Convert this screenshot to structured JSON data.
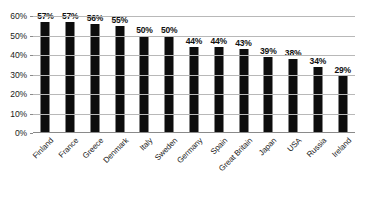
{
  "chart_data": {
    "type": "bar",
    "title": "",
    "subtitle": "",
    "xlabel": "",
    "ylabel": "",
    "ylim": [
      0,
      60
    ],
    "grid": true,
    "legend": false,
    "orientation": "vertical",
    "bar_color": "#0d0d0d",
    "gridline_color": "#b8b8b8",
    "background_color": "#ffffff",
    "categories": [
      "Finland",
      "France",
      "Greece",
      "Denmark",
      "Italy",
      "Sweden",
      "Germany",
      "Spain",
      "Great Britain",
      "Japan",
      "USA",
      "Russia",
      "Ireland"
    ],
    "values": [
      57,
      57,
      56,
      55,
      50,
      50,
      44,
      44,
      43,
      39,
      38,
      34,
      29
    ],
    "data_labels": [
      "57%",
      "57%",
      "56%",
      "55%",
      "50%",
      "50%",
      "44%",
      "44%",
      "43%",
      "39%",
      "38%",
      "34%",
      "29%"
    ],
    "y_ticks": [
      60,
      50,
      40,
      30,
      20,
      10,
      0
    ],
    "y_tick_labels": [
      "60%",
      "50%",
      "40%",
      "30%",
      "20%",
      "10%",
      "0%"
    ]
  }
}
